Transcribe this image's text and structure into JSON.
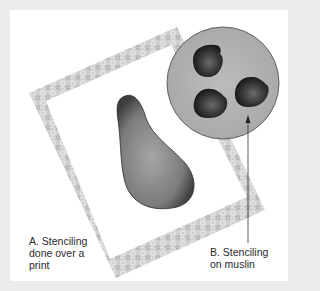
{
  "figure": {
    "caption_a": {
      "lines": [
        "A. Stenciling",
        "done over a",
        "print"
      ]
    },
    "caption_b": {
      "lines": [
        "B. Stenciling",
        "on muslin"
      ]
    }
  },
  "colors": {
    "background": "#ececec",
    "panel": "#ffffff",
    "frame": "#c9c9c9",
    "pear": "#7a7a7a",
    "circle": "#b4b4b4",
    "blobs": "#2e2e2e",
    "text": "#2a2a2a"
  }
}
